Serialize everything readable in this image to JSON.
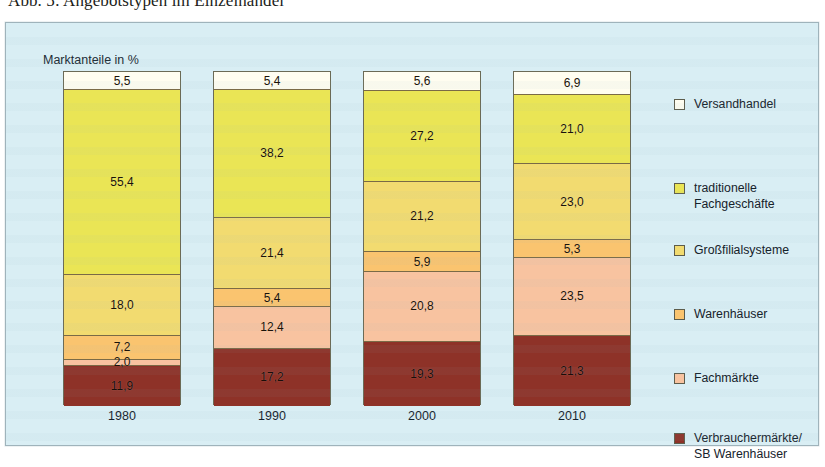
{
  "figure": {
    "title": "Abb. 5: Angebotstypen im Einzelhandel"
  },
  "chart": {
    "axis_title": "Marktanteile in %"
  },
  "legend": {
    "items": [
      {
        "label": "Versandhandel",
        "color": "#fffdf0"
      },
      {
        "label": "traditionelle\nFachgeschäfte",
        "color": "#eae555"
      },
      {
        "label": "Großfilialsysteme",
        "color": "#f2db70"
      },
      {
        "label": "Warenhäuser",
        "color": "#fac46f"
      },
      {
        "label": "Fachmärkte",
        "color": "#f8c3a0"
      },
      {
        "label": "Verbrauchermärkte/\nSB Warenhäuser",
        "color": "#8e3228"
      }
    ]
  },
  "chart_data": {
    "type": "bar",
    "stacked": true,
    "title": "Abb. 5: Angebotstypen im Einzelhandel",
    "xlabel": "",
    "ylabel": "Marktanteile in %",
    "ylim": [
      0,
      100
    ],
    "grid": false,
    "legend_position": "right",
    "categories": [
      "1980",
      "1990",
      "2000",
      "2010"
    ],
    "series": [
      {
        "name": "Versandhandel",
        "color": "#fffdf0",
        "values": [
          5.5,
          5.4,
          5.6,
          6.9
        ],
        "labels": [
          "5,5",
          "5,4",
          "5,6",
          "6,9"
        ]
      },
      {
        "name": "traditionelle Fachgeschäfte",
        "color": "#eae555",
        "values": [
          55.4,
          38.2,
          27.2,
          21.0
        ],
        "labels": [
          "55,4",
          "38,2",
          "27,2",
          "21,0"
        ]
      },
      {
        "name": "Großfilialsysteme",
        "color": "#f2db70",
        "values": [
          18.0,
          21.4,
          21.2,
          23.0
        ],
        "labels": [
          "18,0",
          "21,4",
          "21,2",
          "23,0"
        ]
      },
      {
        "name": "Warenhäuser",
        "color": "#fac46f",
        "values": [
          7.2,
          5.4,
          5.9,
          5.3
        ],
        "labels": [
          "7,2",
          "5,4",
          "5,9",
          "5,3"
        ]
      },
      {
        "name": "Fachmärkte",
        "color": "#f8c3a0",
        "values": [
          2.0,
          12.4,
          20.8,
          23.5
        ],
        "labels": [
          "2,0",
          "12,4",
          "20,8",
          "23,5"
        ]
      },
      {
        "name": "Verbrauchermärkte/SB Warenhäuser",
        "color": "#8e3228",
        "values": [
          11.9,
          17.2,
          19.3,
          21.3
        ],
        "labels": [
          "11,9",
          "17,2",
          "19,3",
          "21,3"
        ]
      }
    ]
  }
}
